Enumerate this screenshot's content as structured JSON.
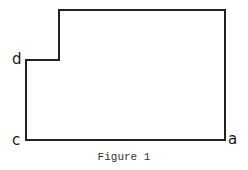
{
  "figure": {
    "caption": "Figure 1",
    "labels": {
      "a": "a",
      "c": "c",
      "d": "d"
    },
    "outline_points": [
      [
        26,
        140
      ],
      [
        225,
        140
      ],
      [
        225,
        10
      ],
      [
        59,
        10
      ],
      [
        59,
        60
      ],
      [
        26,
        60
      ]
    ],
    "stroke_color": "#222222"
  }
}
